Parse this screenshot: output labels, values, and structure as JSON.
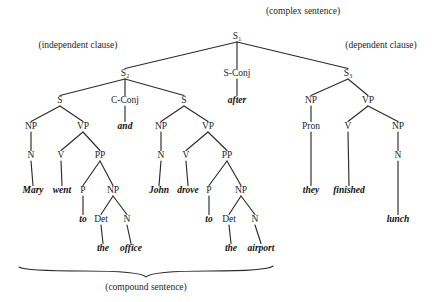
{
  "diagram": {
    "title_annotations": [
      {
        "id": "complex-sentence",
        "text": "(complex sentence)",
        "x": 303,
        "y": 14
      },
      {
        "id": "independent-clause",
        "text": "(independent clause)",
        "x": 78,
        "y": 48
      },
      {
        "id": "dependent-clause",
        "text": "(dependent clause)",
        "x": 381,
        "y": 48
      },
      {
        "id": "compound-sentence",
        "text": "(compound sentence)",
        "x": 146,
        "y": 290
      }
    ],
    "nodes": [
      {
        "id": "S1",
        "label": "S",
        "sub": "1",
        "x": 237,
        "y": 39
      },
      {
        "id": "S2",
        "label": "S",
        "sub": "2",
        "x": 125,
        "y": 76
      },
      {
        "id": "SCONJ",
        "label": "S-Conj",
        "sub": "",
        "x": 237,
        "y": 76
      },
      {
        "id": "S3",
        "label": "S",
        "sub": "3",
        "x": 348,
        "y": 76
      },
      {
        "id": "S2a",
        "label": "S",
        "sub": "",
        "x": 60,
        "y": 103
      },
      {
        "id": "CCONJ",
        "label": "C-Conj",
        "sub": "",
        "x": 125,
        "y": 103
      },
      {
        "id": "S2b",
        "label": "S",
        "sub": "",
        "x": 184,
        "y": 103
      },
      {
        "id": "NP-L",
        "label": "NP",
        "sub": "",
        "x": 31,
        "y": 129
      },
      {
        "id": "VP-L",
        "label": "VP",
        "sub": "",
        "x": 83,
        "y": 129
      },
      {
        "id": "NP-M",
        "label": "NP",
        "sub": "",
        "x": 161,
        "y": 129
      },
      {
        "id": "VP-M",
        "label": "VP",
        "sub": "",
        "x": 208,
        "y": 129
      },
      {
        "id": "NP-R",
        "label": "NP",
        "sub": "",
        "x": 311,
        "y": 103
      },
      {
        "id": "VP-R",
        "label": "VP",
        "sub": "",
        "x": 368,
        "y": 103
      },
      {
        "id": "N-L",
        "label": "N",
        "sub": "",
        "x": 31,
        "y": 158
      },
      {
        "id": "V-L",
        "label": "V",
        "sub": "",
        "x": 61,
        "y": 158
      },
      {
        "id": "PP-L",
        "label": "PP",
        "sub": "",
        "x": 100,
        "y": 158
      },
      {
        "id": "N-M",
        "label": "N",
        "sub": "",
        "x": 161,
        "y": 158
      },
      {
        "id": "V-M",
        "label": "V",
        "sub": "",
        "x": 186,
        "y": 158
      },
      {
        "id": "PP-M",
        "label": "PP",
        "sub": "",
        "x": 227,
        "y": 158
      },
      {
        "id": "PRON-R",
        "label": "Pron",
        "sub": "",
        "x": 311,
        "y": 129
      },
      {
        "id": "V-R",
        "label": "V",
        "sub": "",
        "x": 348,
        "y": 129
      },
      {
        "id": "NP-R2",
        "label": "NP",
        "sub": "",
        "x": 398,
        "y": 129
      },
      {
        "id": "P-L",
        "label": "P",
        "sub": "",
        "x": 83,
        "y": 193
      },
      {
        "id": "NP-L2",
        "label": "NP",
        "sub": "",
        "x": 113,
        "y": 193
      },
      {
        "id": "P-M",
        "label": "P",
        "sub": "",
        "x": 209,
        "y": 193
      },
      {
        "id": "NP-M2",
        "label": "NP",
        "sub": "",
        "x": 241,
        "y": 193
      },
      {
        "id": "N-R",
        "label": "N",
        "sub": "",
        "x": 398,
        "y": 158
      },
      {
        "id": "DET-L",
        "label": "Det",
        "sub": "",
        "x": 101,
        "y": 222
      },
      {
        "id": "N-L2",
        "label": "N",
        "sub": "",
        "x": 127,
        "y": 222
      },
      {
        "id": "DET-M",
        "label": "Det",
        "sub": "",
        "x": 229,
        "y": 222
      },
      {
        "id": "N-M2",
        "label": "N",
        "sub": "",
        "x": 255,
        "y": 222
      }
    ],
    "leaves": [
      {
        "id": "leaf-after",
        "text": "after",
        "x": 237,
        "y": 103
      },
      {
        "id": "leaf-and",
        "text": "and",
        "x": 125,
        "y": 129
      },
      {
        "id": "leaf-mary",
        "text": "Mary",
        "x": 33,
        "y": 193
      },
      {
        "id": "leaf-went",
        "text": "went",
        "x": 62,
        "y": 193
      },
      {
        "id": "leaf-john",
        "text": "John",
        "x": 159,
        "y": 193
      },
      {
        "id": "leaf-drove",
        "text": "drove",
        "x": 188,
        "y": 193
      },
      {
        "id": "leaf-they",
        "text": "they",
        "x": 311,
        "y": 193
      },
      {
        "id": "leaf-finished",
        "text": "finished",
        "x": 349,
        "y": 193
      },
      {
        "id": "leaf-to-1",
        "text": "to",
        "x": 83,
        "y": 222
      },
      {
        "id": "leaf-to-2",
        "text": "to",
        "x": 209,
        "y": 222
      },
      {
        "id": "leaf-lunch",
        "text": "lunch",
        "x": 398,
        "y": 222
      },
      {
        "id": "leaf-the-1",
        "text": "the",
        "x": 103,
        "y": 251
      },
      {
        "id": "leaf-office",
        "text": "office",
        "x": 131,
        "y": 251
      },
      {
        "id": "leaf-the-2",
        "text": "the",
        "x": 231,
        "y": 251
      },
      {
        "id": "leaf-airport",
        "text": "airport",
        "x": 261,
        "y": 251
      }
    ],
    "edges": [
      {
        "from": "S1",
        "to": "S2"
      },
      {
        "from": "S1",
        "to": "SCONJ"
      },
      {
        "from": "S1",
        "to": "S3"
      },
      {
        "from": "S2",
        "to": "S2a"
      },
      {
        "from": "S2",
        "to": "CCONJ"
      },
      {
        "from": "S2",
        "to": "S2b"
      },
      {
        "from": "SCONJ",
        "to": "leaf-after"
      },
      {
        "from": "CCONJ",
        "to": "leaf-and"
      },
      {
        "from": "S2a",
        "to": "NP-L"
      },
      {
        "from": "S2a",
        "to": "VP-L"
      },
      {
        "from": "S2b",
        "to": "NP-M"
      },
      {
        "from": "S2b",
        "to": "VP-M"
      },
      {
        "from": "S3",
        "to": "NP-R"
      },
      {
        "from": "S3",
        "to": "VP-R"
      },
      {
        "from": "NP-L",
        "to": "N-L"
      },
      {
        "from": "VP-L",
        "to": "V-L"
      },
      {
        "from": "VP-L",
        "to": "PP-L"
      },
      {
        "from": "NP-M",
        "to": "N-M"
      },
      {
        "from": "VP-M",
        "to": "V-M"
      },
      {
        "from": "VP-M",
        "to": "PP-M"
      },
      {
        "from": "NP-R",
        "to": "PRON-R"
      },
      {
        "from": "VP-R",
        "to": "V-R"
      },
      {
        "from": "VP-R",
        "to": "NP-R2"
      },
      {
        "from": "N-L",
        "to": "leaf-mary"
      },
      {
        "from": "V-L",
        "to": "leaf-went"
      },
      {
        "from": "PP-L",
        "to": "P-L"
      },
      {
        "from": "PP-L",
        "to": "NP-L2"
      },
      {
        "from": "N-M",
        "to": "leaf-john"
      },
      {
        "from": "V-M",
        "to": "leaf-drove"
      },
      {
        "from": "PP-M",
        "to": "P-M"
      },
      {
        "from": "PP-M",
        "to": "NP-M2"
      },
      {
        "from": "PRON-R",
        "to": "leaf-they"
      },
      {
        "from": "V-R",
        "to": "leaf-finished"
      },
      {
        "from": "NP-R2",
        "to": "N-R"
      },
      {
        "from": "P-L",
        "to": "leaf-to-1"
      },
      {
        "from": "NP-L2",
        "to": "DET-L"
      },
      {
        "from": "NP-L2",
        "to": "N-L2"
      },
      {
        "from": "P-M",
        "to": "leaf-to-2"
      },
      {
        "from": "NP-M2",
        "to": "DET-M"
      },
      {
        "from": "NP-M2",
        "to": "N-M2"
      },
      {
        "from": "N-R",
        "to": "leaf-lunch"
      },
      {
        "from": "DET-L",
        "to": "leaf-the-1"
      },
      {
        "from": "N-L2",
        "to": "leaf-office"
      },
      {
        "from": "DET-M",
        "to": "leaf-the-2"
      },
      {
        "from": "N-M2",
        "to": "leaf-airport"
      }
    ],
    "brace": {
      "id": "compound-sentence-brace",
      "left_x": 19,
      "right_x": 273,
      "mid_x": 146,
      "y": 271,
      "tip_y": 277
    },
    "colors": {
      "ink": "#262626",
      "background": "#ffffff"
    }
  }
}
